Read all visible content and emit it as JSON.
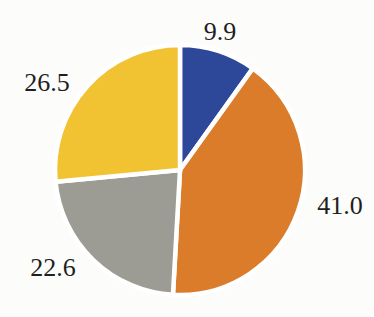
{
  "page": {
    "background": "#fcfcfa"
  },
  "chart_data": {
    "type": "pie",
    "title": "",
    "slices": [
      {
        "name": "blue",
        "label": "9.9",
        "value": 9.9,
        "color": "#2e4899",
        "label_px": {
          "x": 220,
          "y": 32
        }
      },
      {
        "name": "orange",
        "label": "41.0",
        "value": 41.0,
        "color": "#db7c2b",
        "label_px": {
          "x": 340,
          "y": 206
        }
      },
      {
        "name": "gray",
        "label": "22.6",
        "value": 22.6,
        "color": "#9c9c94",
        "label_px": {
          "x": 53,
          "y": 268
        }
      },
      {
        "name": "yellow",
        "label": "26.5",
        "value": 26.5,
        "color": "#f1c232",
        "label_px": {
          "x": 47,
          "y": 83
        }
      }
    ],
    "total": 100.0,
    "start_angle_deg": 0,
    "direction": "clockwise",
    "center_px": {
      "x": 180,
      "y": 170
    },
    "radius_px": 125,
    "divider_color": "#ffffff",
    "divider_width_px": 4.5,
    "legend": "none"
  }
}
